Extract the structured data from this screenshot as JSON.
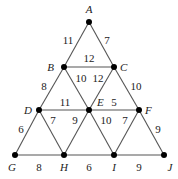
{
  "diagram": {
    "type": "weighted-graph",
    "nodes": [
      {
        "id": "A",
        "x": 89,
        "y": 22,
        "lx": 89,
        "ly": 13,
        "anchor": "middle"
      },
      {
        "id": "B",
        "x": 64,
        "y": 67,
        "lx": 54,
        "ly": 71,
        "anchor": "end"
      },
      {
        "id": "C",
        "x": 114,
        "y": 67,
        "lx": 120,
        "ly": 71,
        "anchor": "start"
      },
      {
        "id": "D",
        "x": 39,
        "y": 110,
        "lx": 32,
        "ly": 114,
        "anchor": "end"
      },
      {
        "id": "E",
        "x": 89,
        "y": 110,
        "lx": 97,
        "ly": 106,
        "anchor": "start"
      },
      {
        "id": "F",
        "x": 139,
        "y": 110,
        "lx": 145,
        "ly": 114,
        "anchor": "start"
      },
      {
        "id": "G",
        "x": 15,
        "y": 155,
        "lx": 12,
        "ly": 171,
        "anchor": "middle"
      },
      {
        "id": "H",
        "x": 64,
        "y": 155,
        "lx": 64,
        "ly": 171,
        "anchor": "middle"
      },
      {
        "id": "I",
        "x": 114,
        "y": 155,
        "lx": 114,
        "ly": 171,
        "anchor": "middle"
      },
      {
        "id": "J",
        "x": 164,
        "y": 155,
        "lx": 170,
        "ly": 171,
        "anchor": "middle"
      }
    ],
    "edges": [
      {
        "from": "A",
        "to": "B",
        "weight": "11",
        "lx": 68,
        "ly": 44
      },
      {
        "from": "A",
        "to": "C",
        "weight": "7",
        "lx": 107,
        "ly": 44
      },
      {
        "from": "B",
        "to": "C",
        "weight": "12",
        "lx": 89,
        "ly": 62
      },
      {
        "from": "B",
        "to": "D",
        "weight": "8",
        "lx": 44,
        "ly": 90
      },
      {
        "from": "B",
        "to": "E",
        "weight": "10",
        "lx": 81,
        "ly": 82
      },
      {
        "from": "C",
        "to": "E",
        "weight": "12",
        "lx": 98,
        "ly": 82
      },
      {
        "from": "C",
        "to": "F",
        "weight": "10",
        "lx": 136,
        "ly": 90
      },
      {
        "from": "D",
        "to": "E",
        "weight": "11",
        "lx": 65,
        "ly": 106
      },
      {
        "from": "E",
        "to": "F",
        "weight": "5",
        "lx": 114,
        "ly": 106
      },
      {
        "from": "D",
        "to": "G",
        "weight": "6",
        "lx": 21,
        "ly": 133
      },
      {
        "from": "D",
        "to": "H",
        "weight": "7",
        "lx": 53,
        "ly": 124
      },
      {
        "from": "E",
        "to": "H",
        "weight": "9",
        "lx": 75,
        "ly": 124
      },
      {
        "from": "E",
        "to": "I",
        "weight": "10",
        "lx": 106,
        "ly": 124
      },
      {
        "from": "F",
        "to": "I",
        "weight": "7",
        "lx": 125,
        "ly": 124
      },
      {
        "from": "F",
        "to": "J",
        "weight": "9",
        "lx": 158,
        "ly": 133
      },
      {
        "from": "G",
        "to": "H",
        "weight": "8",
        "lx": 39,
        "ly": 171
      },
      {
        "from": "H",
        "to": "I",
        "weight": "6",
        "lx": 89,
        "ly": 171
      },
      {
        "from": "I",
        "to": "J",
        "weight": "9",
        "lx": 139,
        "ly": 171
      }
    ]
  }
}
